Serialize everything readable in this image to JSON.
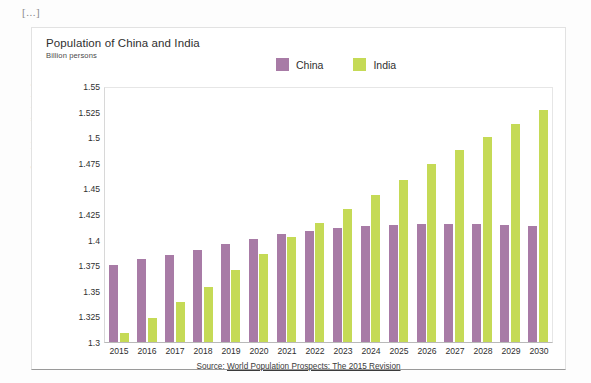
{
  "page": {
    "ellipsis_marker": "[...]",
    "spine_credit": "Banco de imagens/Arquivo da editora"
  },
  "chart": {
    "title": "Population of China and India",
    "subtitle": "Billion persons",
    "source_prefix": "Source: ",
    "source_link": "World Population Prospects: The 2015 Revision"
  },
  "colors": {
    "china": "#a87ba6",
    "india": "#c5da56",
    "card_border": "#e2e2e2",
    "axis": "#b9b9b9",
    "text": "#2f2f2f"
  },
  "chart_data": {
    "type": "bar",
    "title": "Population of China and India",
    "subtitle": "Billion persons",
    "xlabel": "",
    "ylabel": "Billion persons",
    "ylim": [
      1.3,
      1.55
    ],
    "ytick_step": 0.025,
    "yticks": [
      1.3,
      1.325,
      1.35,
      1.375,
      1.4,
      1.425,
      1.45,
      1.475,
      1.5,
      1.525,
      1.55
    ],
    "ytick_labels": [
      "1.3",
      "1.325",
      "1.35",
      "1.375",
      "1.4",
      "1.425",
      "1.45",
      "1.475",
      "1.5",
      "1.525",
      "1.55"
    ],
    "grid": false,
    "legend_position": "top",
    "categories": [
      "2015",
      "2016",
      "2017",
      "2018",
      "2019",
      "2020",
      "2021",
      "2022",
      "2023",
      "2024",
      "2025",
      "2026",
      "2027",
      "2028",
      "2029",
      "2030"
    ],
    "series": [
      {
        "name": "China",
        "color": "#a87ba6",
        "values": [
          1.376,
          1.382,
          1.386,
          1.391,
          1.396,
          1.401,
          1.406,
          1.409,
          1.412,
          1.414,
          1.415,
          1.416,
          1.416,
          1.416,
          1.415,
          1.414
        ]
      },
      {
        "name": "India",
        "color": "#c5da56",
        "values": [
          1.309,
          1.324,
          1.339,
          1.354,
          1.371,
          1.387,
          1.403,
          1.417,
          1.431,
          1.445,
          1.459,
          1.475,
          1.489,
          1.502,
          1.515,
          1.528
        ]
      }
    ]
  }
}
